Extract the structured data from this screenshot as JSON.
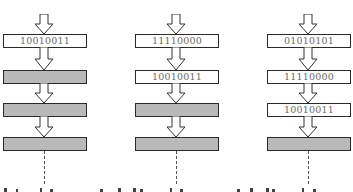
{
  "diagram": {
    "type": "shift-register-sequence",
    "colors": {
      "empty_slot": "#b9b9b9",
      "filled_slot": "#ffffff",
      "border": "#2a2a2a",
      "text": "#6a6a6a"
    },
    "columns": [
      {
        "step": 1,
        "slots": [
          {
            "value": "10010011",
            "filled": true
          },
          {
            "value": "",
            "filled": false
          },
          {
            "value": "",
            "filled": false
          },
          {
            "value": "",
            "filled": false
          }
        ]
      },
      {
        "step": 2,
        "slots": [
          {
            "value": "11110000",
            "filled": true
          },
          {
            "value": "10010011",
            "filled": true
          },
          {
            "value": "",
            "filled": false
          },
          {
            "value": "",
            "filled": false
          }
        ]
      },
      {
        "step": 3,
        "slots": [
          {
            "value": "01010101",
            "filled": true
          },
          {
            "value": "11110000",
            "filled": true
          },
          {
            "value": "10010011",
            "filled": true
          },
          {
            "value": "",
            "filled": false
          }
        ]
      }
    ]
  }
}
